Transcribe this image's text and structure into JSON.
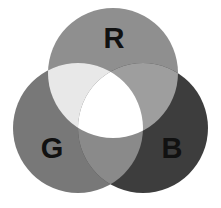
{
  "figure": {
    "background_color": "#ffffff",
    "width": 221,
    "height": 208
  },
  "chart_data": {
    "type": "venn",
    "set_count": 3,
    "grid": false,
    "legend": "none",
    "xlim": [
      0,
      221
    ],
    "ylim": [
      0,
      208
    ],
    "sets": [
      {
        "id": "R",
        "label": "R",
        "name": "Red",
        "color": "#8f8f8f",
        "cx": 113,
        "cy": 73,
        "r": 65,
        "label_x": 114,
        "label_y": 38
      },
      {
        "id": "G",
        "label": "G",
        "name": "Green",
        "color": "#787878",
        "cx": 78,
        "cy": 128,
        "r": 65,
        "label_x": 52,
        "label_y": 148
      },
      {
        "id": "B",
        "label": "B",
        "name": "Blue",
        "color": "#3d3d3d",
        "cx": 143,
        "cy": 128,
        "r": 65,
        "label_x": 172,
        "label_y": 148
      }
    ],
    "regions": [
      {
        "id": "R",
        "members": [
          "R"
        ],
        "label": "Red",
        "color": "#8f8f8f"
      },
      {
        "id": "G",
        "members": [
          "G"
        ],
        "label": "Green",
        "color": "#787878"
      },
      {
        "id": "B",
        "members": [
          "B"
        ],
        "label": "Blue",
        "color": "#3d3d3d"
      },
      {
        "id": "RG",
        "members": [
          "R",
          "G"
        ],
        "label": "Yellow",
        "color": "#e8e8e8"
      },
      {
        "id": "RB",
        "members": [
          "R",
          "B"
        ],
        "label": "Magenta",
        "color": "#9e9e9e"
      },
      {
        "id": "GB",
        "members": [
          "G",
          "B"
        ],
        "label": "Cyan",
        "color": "#8a8a8a"
      },
      {
        "id": "RGB",
        "members": [
          "R",
          "G",
          "B"
        ],
        "label": "White",
        "color": "#ffffff"
      }
    ]
  },
  "labels": {
    "r": "R",
    "g": "G",
    "b": "B"
  }
}
